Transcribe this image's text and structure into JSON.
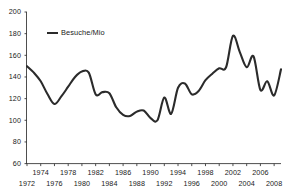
{
  "chart_data": {
    "type": "line",
    "title": "",
    "subtitle": "",
    "xlabel": "",
    "ylabel": "",
    "legend_position": "top-left",
    "grid": false,
    "xlim": [
      1972,
      2009
    ],
    "ylim": [
      60,
      200
    ],
    "y_ticks": [
      60,
      80,
      100,
      120,
      140,
      160,
      180,
      200
    ],
    "x_ticks_upper_row": [
      1974,
      1978,
      1982,
      1986,
      1990,
      1994,
      1998,
      2002,
      2006
    ],
    "x_ticks_lower_row": [
      1972,
      1976,
      1980,
      1984,
      1988,
      1992,
      1996,
      2000,
      2004,
      2008
    ],
    "series": [
      {
        "name": "Besuche/Mio",
        "color": "#2b2b2b",
        "x": [
          1972,
          1973,
          1974,
          1975,
          1976,
          1977,
          1978,
          1979,
          1980,
          1981,
          1982,
          1983,
          1984,
          1985,
          1986,
          1987,
          1988,
          1989,
          1990,
          1991,
          1992,
          1993,
          1994,
          1995,
          1996,
          1997,
          1998,
          1999,
          2000,
          2001,
          2002,
          2003,
          2004,
          2005,
          2006,
          2007,
          2008,
          2009
        ],
        "values": [
          150,
          144,
          136,
          124,
          115,
          122,
          131,
          140,
          145,
          144,
          124,
          126,
          125,
          112,
          105,
          104,
          108,
          109,
          102,
          100,
          121,
          106,
          130,
          134,
          124,
          127,
          137,
          143,
          148,
          149,
          178,
          163,
          149,
          159,
          128,
          136,
          123,
          147
        ]
      }
    ],
    "legend_entries": [
      {
        "label": "Besuche/Mio",
        "color": "#2b2b2b"
      }
    ]
  }
}
